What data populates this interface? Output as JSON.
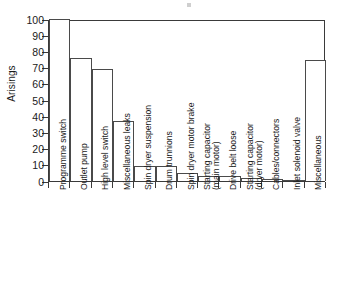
{
  "chart_data": {
    "type": "bar",
    "title": "",
    "xlabel": "",
    "ylabel": "Arisings",
    "ylim": [
      0,
      100
    ],
    "yticks": [
      0,
      10,
      20,
      30,
      40,
      50,
      60,
      70,
      80,
      90,
      100
    ],
    "grid": false,
    "legend": null,
    "categories": [
      "Programme switch",
      "Outlet pump",
      "High level switch",
      "Miscellaneous leaks",
      "Spin dryer suspension",
      "Drum trunnions",
      "Spin dryer motor brake",
      "Starting capacitor (main motor)",
      "Drive belt loose",
      "Starting capacitor (dryer motor)",
      "Cables/connectors",
      "Inlet solenoid valve",
      "Miscellaneous"
    ],
    "category_lines": [
      [
        "Programme switch",
        ""
      ],
      [
        "Outlet pump",
        ""
      ],
      [
        "High level switch",
        ""
      ],
      [
        "Miscellaneous leaks",
        ""
      ],
      [
        "Spin dryer suspension",
        ""
      ],
      [
        "Drum trunnions",
        ""
      ],
      [
        "Spin dryer motor brake",
        ""
      ],
      [
        "Starting capacitor",
        "(main motor)"
      ],
      [
        "Drive belt loose",
        ""
      ],
      [
        "Starting capacitor",
        "(dryer motor)"
      ],
      [
        "Cables/connectors",
        ""
      ],
      [
        "Inlet solenoid valve",
        ""
      ],
      [
        "Miscellaneous",
        ""
      ]
    ],
    "values": [
      100,
      76,
      69,
      37,
      9.5,
      9.5,
      5,
      3,
      3,
      2,
      1.5,
      0.5,
      75
    ],
    "colors": {
      "bar_fill": "#ffffff",
      "bar_edge": "#4a4a4a",
      "axis": "#3a3a3a",
      "text": "#1a1a1a",
      "background": "#ffffff"
    }
  }
}
